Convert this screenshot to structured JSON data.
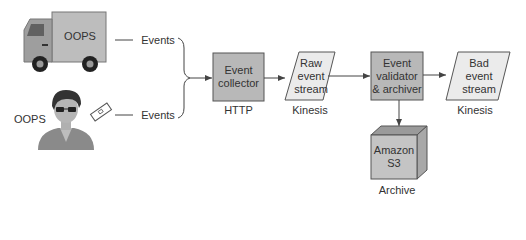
{
  "diagram": {
    "sources": [
      {
        "name": "truck",
        "label": "OOPS",
        "edge_label": "Events"
      },
      {
        "name": "person",
        "label": "OOPS",
        "edge_label": "Events"
      }
    ],
    "nodes": [
      {
        "id": "collector",
        "label_line1": "Event",
        "label_line2": "collector",
        "caption": "HTTP",
        "shape": "rectangle"
      },
      {
        "id": "raw",
        "label_line1": "Raw",
        "label_line2": "event",
        "label_line3": "stream",
        "caption": "Kinesis",
        "shape": "parallelogram"
      },
      {
        "id": "validator",
        "label_line1": "Event",
        "label_line2": "validator",
        "label_line3": "& archiver",
        "shape": "rectangle"
      },
      {
        "id": "bad",
        "label_line1": "Bad",
        "label_line2": "event",
        "label_line3": "stream",
        "caption": "Kinesis",
        "shape": "parallelogram"
      },
      {
        "id": "s3",
        "label_line1": "Amazon",
        "label_line2": "S3",
        "caption": "Archive",
        "shape": "cube"
      }
    ],
    "edges": [
      {
        "from": "truck",
        "to": "collector",
        "label": "Events"
      },
      {
        "from": "person",
        "to": "collector",
        "label": "Events"
      },
      {
        "from": "collector",
        "to": "raw"
      },
      {
        "from": "raw",
        "to": "validator"
      },
      {
        "from": "validator",
        "to": "bad"
      },
      {
        "from": "validator",
        "to": "s3"
      }
    ],
    "colors": {
      "box_fill": "#b8b8b8",
      "stream_fill": "#ebebeb",
      "stroke": "#555555",
      "text": "#333333"
    }
  }
}
